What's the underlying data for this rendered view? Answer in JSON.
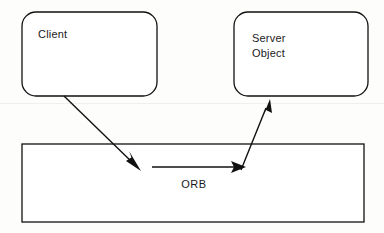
{
  "diagram": {
    "background_color": "#fdfdfc",
    "stroke_color": "#111111",
    "text_color": "#1a1a1a",
    "nodes": [
      {
        "id": "client",
        "label": "Client",
        "shape": "rounded-rectangle",
        "x": 22,
        "y": 12,
        "width": 135,
        "height": 84,
        "radius": 14,
        "label_x": 38,
        "label_y": 38
      },
      {
        "id": "server-object",
        "label_line1": "Server",
        "label_line2": "Object",
        "shape": "rounded-rectangle",
        "x": 234,
        "y": 12,
        "width": 134,
        "height": 84,
        "radius": 14,
        "label_x": 252,
        "label_y1": 42,
        "label_y2": 57
      },
      {
        "id": "orb",
        "label": "ORB",
        "shape": "rectangle",
        "x": 22,
        "y": 144,
        "width": 342,
        "height": 78,
        "label_x": 194,
        "label_y": 188
      }
    ],
    "edges": [
      {
        "id": "client-to-orb",
        "from": "client",
        "to": "orb",
        "direction": "down-right",
        "x1": 64,
        "y1": 96,
        "x2": 140,
        "y2": 170
      },
      {
        "id": "orb-internal",
        "from": "orb",
        "to": "orb",
        "direction": "right",
        "x1": 152,
        "y1": 167,
        "x2": 245,
        "y2": 167
      },
      {
        "id": "orb-to-server-object",
        "from": "orb",
        "to": "server-object",
        "direction": "up-right",
        "x1": 241,
        "y1": 170,
        "x2": 270,
        "y2": 99
      }
    ]
  }
}
